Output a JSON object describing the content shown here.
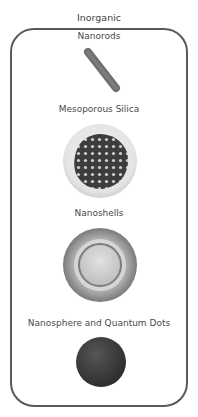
{
  "title": "Inorganic",
  "items": [
    {
      "label": "Nanorods",
      "icon": "nanorod-icon"
    },
    {
      "label": "Mesoporous Silica",
      "icon": "mesoporous-silica-icon"
    },
    {
      "label": "Nanoshells",
      "icon": "nanoshell-icon"
    },
    {
      "label": "Nanosphere and Quantum Dots",
      "icon": "nanosphere-icon"
    }
  ],
  "colors": {
    "frame": "#5a5a5a",
    "rod": "#707070",
    "sphere": "#3a3a3a",
    "shell_outer": "#8a8a8a",
    "shell_inner": "#c8c8c8"
  }
}
